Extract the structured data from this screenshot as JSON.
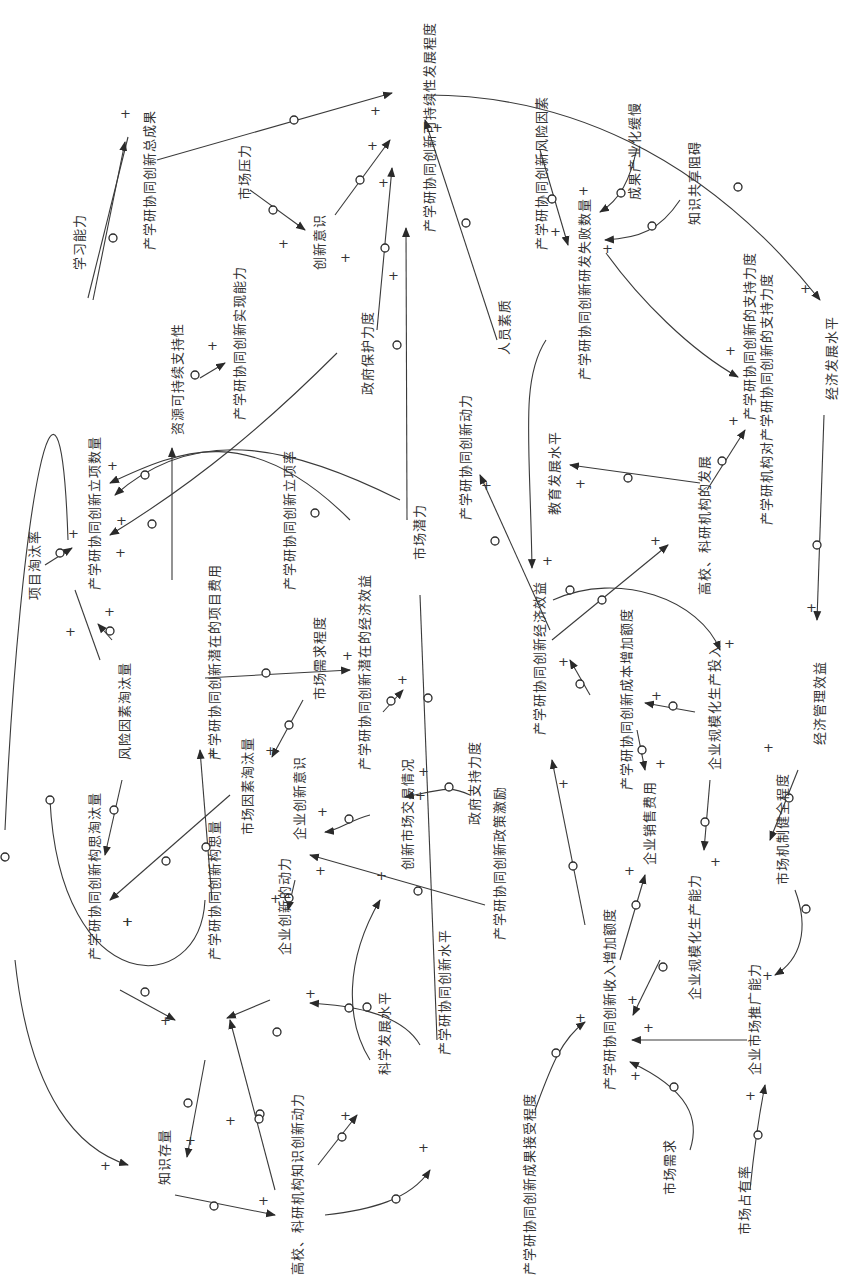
{
  "diagram": {
    "type": "causal-loop-diagram",
    "orientation": "rotated-90-ccw",
    "colors": {
      "line": "#3a3a3a",
      "text": "#333333",
      "background": "#ffffff"
    },
    "polarity_symbol": "+",
    "delay_marker": "circle",
    "nodes": [
      {
        "id": "n1",
        "label": "产学研协同创新可持续性发展程度",
        "x": 430,
        "y": 232
      },
      {
        "id": "n2",
        "label": "产学研协同创新总成果",
        "x": 150,
        "y": 250
      },
      {
        "id": "n3",
        "label": "学习能力",
        "x": 80,
        "y": 270
      },
      {
        "id": "n4",
        "label": "市场压力",
        "x": 245,
        "y": 200
      },
      {
        "id": "n5",
        "label": "创新意识",
        "x": 320,
        "y": 270
      },
      {
        "id": "n6",
        "label": "产学研协同创新实现能力",
        "x": 240,
        "y": 420
      },
      {
        "id": "n7",
        "label": "资源可持续支持性",
        "x": 178,
        "y": 435
      },
      {
        "id": "n8",
        "label": "政府保护力度",
        "x": 368,
        "y": 395
      },
      {
        "id": "n9",
        "label": "产学研协同创新动力",
        "x": 466,
        "y": 520
      },
      {
        "id": "n10",
        "label": "人员素质",
        "x": 505,
        "y": 355
      },
      {
        "id": "n11",
        "label": "产学研协同创新风险因素",
        "x": 542,
        "y": 250
      },
      {
        "id": "n12",
        "label": "成果产业化缓慢",
        "x": 635,
        "y": 200
      },
      {
        "id": "n13",
        "label": "产学研协同创新研发失败数量",
        "x": 585,
        "y": 380
      },
      {
        "id": "n14",
        "label": "知识共享阻碍",
        "x": 695,
        "y": 225
      },
      {
        "id": "n15",
        "label": "产学研协同创新的支持力度",
        "x": 750,
        "y": 420
      },
      {
        "id": "n16",
        "label": "经济发展水平",
        "x": 832,
        "y": 400
      },
      {
        "id": "n17",
        "label": "产学研协同创新立项数量",
        "x": 95,
        "y": 590
      },
      {
        "id": "n18",
        "label": "产学研协同创新立项率",
        "x": 290,
        "y": 590
      },
      {
        "id": "n19",
        "label": "项目淘汰率",
        "x": 35,
        "y": 600
      },
      {
        "id": "n20",
        "label": "产学研协同创新潜在的项目费用",
        "x": 215,
        "y": 760
      },
      {
        "id": "n21",
        "label": "市场潜力",
        "x": 420,
        "y": 560
      },
      {
        "id": "n22",
        "label": "教育发展水平",
        "x": 555,
        "y": 515
      },
      {
        "id": "n23",
        "label": "高校、科研机构的发展",
        "x": 705,
        "y": 595
      },
      {
        "id": "n24",
        "label": "产学研机构对产学研协同创新的支持力度",
        "x": 767,
        "y": 525
      },
      {
        "id": "n25",
        "label": "产学研协同创新经济效益",
        "x": 540,
        "y": 735
      },
      {
        "id": "n26",
        "label": "产学研协同创新成本增加额度",
        "x": 627,
        "y": 790
      },
      {
        "id": "n27",
        "label": "风险因素淘汰量",
        "x": 125,
        "y": 760
      },
      {
        "id": "n28",
        "label": "市场需求程度",
        "x": 320,
        "y": 700
      },
      {
        "id": "n29",
        "label": "产学研协同创新潜在的经济效益",
        "x": 365,
        "y": 770
      },
      {
        "id": "n30",
        "label": "企业规模化生产投入",
        "x": 715,
        "y": 770
      },
      {
        "id": "n31",
        "label": "经济管理效益",
        "x": 820,
        "y": 745
      },
      {
        "id": "n32",
        "label": "市场因素淘汰量",
        "x": 248,
        "y": 835
      },
      {
        "id": "n33",
        "label": "企业创新意识",
        "x": 300,
        "y": 840
      },
      {
        "id": "n34",
        "label": "创新市场交易情况",
        "x": 408,
        "y": 870
      },
      {
        "id": "n35",
        "label": "政府支持力度",
        "x": 475,
        "y": 825
      },
      {
        "id": "n36",
        "label": "产学研协同创新构思淘汰量",
        "x": 95,
        "y": 960
      },
      {
        "id": "n37",
        "label": "产学研协同创新构思量",
        "x": 215,
        "y": 960
      },
      {
        "id": "n38",
        "label": "企业创新的动力",
        "x": 285,
        "y": 955
      },
      {
        "id": "n39",
        "label": "产学研协同创新政策激励",
        "x": 500,
        "y": 940
      },
      {
        "id": "n40",
        "label": "企业销售费用",
        "x": 650,
        "y": 865
      },
      {
        "id": "n41",
        "label": "企业规模化生产能力",
        "x": 695,
        "y": 1000
      },
      {
        "id": "n42",
        "label": "市场机制健全程度",
        "x": 783,
        "y": 885
      },
      {
        "id": "n43",
        "label": "产学研协同创新收入增加额度",
        "x": 610,
        "y": 1090
      },
      {
        "id": "n44",
        "label": "产学研协同创新水平",
        "x": 445,
        "y": 1055
      },
      {
        "id": "n45",
        "label": "科学发展水平",
        "x": 385,
        "y": 1075
      },
      {
        "id": "n46",
        "label": "高校、科研机构知识创新动力",
        "x": 298,
        "y": 1275
      },
      {
        "id": "n47",
        "label": "知识存量",
        "x": 165,
        "y": 1185
      },
      {
        "id": "n48",
        "label": "产学研协同创新成果接受程度",
        "x": 530,
        "y": 1275
      },
      {
        "id": "n49",
        "label": "市场需求",
        "x": 670,
        "y": 1195
      },
      {
        "id": "n50",
        "label": "市场占有率",
        "x": 745,
        "y": 1235
      },
      {
        "id": "n51",
        "label": "企业市场推广能力",
        "x": 755,
        "y": 1075
      }
    ]
  }
}
